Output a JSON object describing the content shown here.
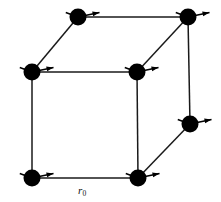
{
  "figure": {
    "kind": "diagram",
    "width": 221,
    "height": 202,
    "background_color": "#ffffff",
    "line_color": "#1a1a1a",
    "atom_color": "#000000",
    "arrow_color": "#000000"
  },
  "labels": {
    "lattice_constant": "r",
    "lattice_constant_subscript": "0"
  },
  "lattice": {
    "description": "Perspective cube, 7 visible vertices, one rear-lower-left vertex hidden",
    "atom_radius": 8.5,
    "vertices": [
      {
        "id": "front-top-left",
        "name": "atom-front-top-left",
        "x": 32,
        "y": 72,
        "visible": true
      },
      {
        "id": "front-top-right",
        "name": "atom-front-top-right",
        "x": 137,
        "y": 72,
        "visible": true
      },
      {
        "id": "front-bottom-left",
        "name": "atom-front-bottom-left",
        "x": 32,
        "y": 178,
        "visible": true
      },
      {
        "id": "front-bottom-right",
        "name": "atom-front-bottom-right",
        "x": 138,
        "y": 178,
        "visible": true
      },
      {
        "id": "back-top-left",
        "name": "atom-back-top-left",
        "x": 78,
        "y": 17,
        "visible": true
      },
      {
        "id": "back-top-right",
        "name": "atom-back-top-right",
        "x": 188,
        "y": 17,
        "visible": true
      },
      {
        "id": "back-bottom-right",
        "name": "atom-back-bottom-right",
        "x": 190,
        "y": 124,
        "visible": true
      },
      {
        "id": "back-bottom-left",
        "name": "atom-back-bottom-left",
        "x": 84,
        "y": 124,
        "visible": false
      }
    ],
    "edges": [
      {
        "id": "front-top",
        "from": "front-top-left",
        "to": "front-top-right"
      },
      {
        "id": "front-left",
        "from": "front-top-left",
        "to": "front-bottom-left"
      },
      {
        "id": "front-bottom",
        "from": "front-bottom-left",
        "to": "front-bottom-right"
      },
      {
        "id": "front-right",
        "from": "front-top-right",
        "to": "front-bottom-right"
      },
      {
        "id": "back-top",
        "from": "back-top-left",
        "to": "back-top-right"
      },
      {
        "id": "back-right-vertical",
        "from": "back-top-right",
        "to": "back-bottom-right"
      },
      {
        "id": "diag-top-left",
        "from": "front-top-left",
        "to": "back-top-left"
      },
      {
        "id": "diag-top-right",
        "from": "front-top-right",
        "to": "back-top-right"
      },
      {
        "id": "diag-bottom-right",
        "from": "front-bottom-right",
        "to": "back-bottom-right"
      }
    ],
    "spins": {
      "description": "Each visible atom carries a spin arrow pointing to the upper-right plus a short tail stub to the lower-left",
      "shaft_length": 22,
      "shaft_angle_deg": -12,
      "tail_length": 13,
      "tail_angle_deg": 200,
      "head_length": 7,
      "head_width": 5,
      "on_vertices": [
        "front-top-left",
        "front-top-right",
        "front-bottom-left",
        "front-bottom-right",
        "back-top-left",
        "back-top-right",
        "back-bottom-right"
      ]
    }
  },
  "annotations": [
    {
      "id": "r0-label",
      "name": "lattice-constant-label",
      "text": "r",
      "subscript": "0",
      "x": 78,
      "y": 185,
      "describes_edge": "front-bottom"
    }
  ]
}
